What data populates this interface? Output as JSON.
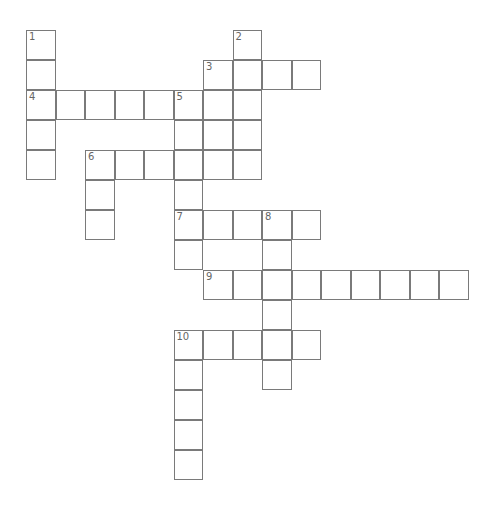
{
  "puzzle": {
    "type": "crossword",
    "cell_size_px": 29.5,
    "origin_px": [
      26,
      30
    ],
    "line_color": "#7a7a7a",
    "number_color": "#666666",
    "entries": [
      {
        "number": "1",
        "direction": "down",
        "col": 0,
        "row": 0,
        "length": 5
      },
      {
        "number": "2",
        "direction": "down",
        "col": 7,
        "row": 0,
        "length": 5
      },
      {
        "number": "3",
        "direction": "across",
        "col": 6,
        "row": 1,
        "length": 4
      },
      {
        "number": "3",
        "direction": "down",
        "col": 6,
        "row": 1,
        "length": 4
      },
      {
        "number": "4",
        "direction": "across",
        "col": 0,
        "row": 2,
        "length": 6
      },
      {
        "number": "5",
        "direction": "down",
        "col": 5,
        "row": 2,
        "length": 6
      },
      {
        "number": "6",
        "direction": "across",
        "col": 2,
        "row": 4,
        "length": 6
      },
      {
        "number": "6",
        "direction": "down",
        "col": 2,
        "row": 4,
        "length": 3
      },
      {
        "number": "7",
        "direction": "across",
        "col": 5,
        "row": 6,
        "length": 5
      },
      {
        "number": "8",
        "direction": "down",
        "col": 8,
        "row": 6,
        "length": 6
      },
      {
        "number": "9",
        "direction": "across",
        "col": 6,
        "row": 8,
        "length": 9
      },
      {
        "number": "10",
        "direction": "across",
        "col": 5,
        "row": 10,
        "length": 5
      },
      {
        "number": "10",
        "direction": "down",
        "col": 5,
        "row": 10,
        "length": 5
      }
    ]
  }
}
